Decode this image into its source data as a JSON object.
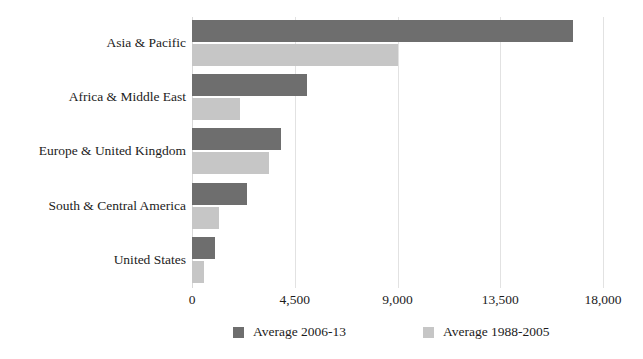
{
  "figure": {
    "title_sliver": "▬▬ ▬▬▬▬ ▬▬▬▬▬",
    "background_color": "#ffffff"
  },
  "chart_data": {
    "type": "bar",
    "orientation": "horizontal",
    "title": "",
    "subtitle": "",
    "xlabel": "",
    "ylabel": "",
    "xlim": [
      0,
      18000
    ],
    "ylim": null,
    "grid": "vertical",
    "xticks": [
      0,
      4500,
      9000,
      13500,
      18000
    ],
    "xtick_labels": [
      "0",
      "4,500",
      "9,000",
      "13,500",
      "18,000"
    ],
    "categories": [
      "Asia & Pacific",
      "Africa & Middle East",
      "Europe & United Kingdom",
      "South & Central America",
      "United States"
    ],
    "legend_position": "bottom-center",
    "series": [
      {
        "name": "Average 2006-13",
        "color": "#6e6e6e",
        "values": [
          16700,
          5050,
          3900,
          2400,
          1020
        ]
      },
      {
        "name": "Average 1988-2005",
        "color": "#c6c6c6",
        "values": [
          9000,
          2110,
          3380,
          1180,
          530
        ]
      }
    ]
  },
  "legend": {
    "entries": [
      {
        "label": "Average 2006-13",
        "color": "#6e6e6e"
      },
      {
        "label": "Average 1988-2005",
        "color": "#c6c6c6"
      }
    ]
  }
}
